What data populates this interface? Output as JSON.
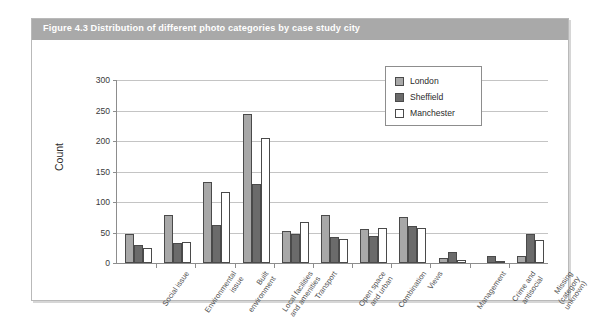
{
  "figure": {
    "caption": "Figure 4.3  Distribution of different photo categories by case study city"
  },
  "chart_data": {
    "type": "bar",
    "title": "Distribution of different photo categories by case study city",
    "xlabel": "",
    "ylabel": "Count",
    "ylim": [
      0,
      300
    ],
    "yticks": [
      "0",
      "50",
      "100",
      "150",
      "200",
      "250",
      "300"
    ],
    "grid": true,
    "legend_position": "top-right",
    "categories": [
      "Social issue",
      "Environmental\nissue",
      "Built\nenvironment",
      "Local facilities\nand amenities",
      "Transport",
      "Open space\nand urban",
      "Combination",
      "Views",
      "Management",
      "Crime and\nantisocial",
      "Missing\n(category\nunknown)"
    ],
    "series": [
      {
        "name": "London",
        "color": "#a8a8a8",
        "values": [
          47,
          78,
          133,
          245,
          52,
          78,
          55,
          75,
          8,
          0,
          12
        ]
      },
      {
        "name": "Sheffield",
        "color": "#6b6b6b",
        "values": [
          30,
          32,
          62,
          130,
          48,
          42,
          45,
          60,
          18,
          11,
          48
        ]
      },
      {
        "name": "Manchester",
        "color": "#ffffff",
        "values": [
          25,
          35,
          117,
          205,
          68,
          40,
          57,
          58,
          5,
          3,
          37
        ]
      }
    ]
  }
}
